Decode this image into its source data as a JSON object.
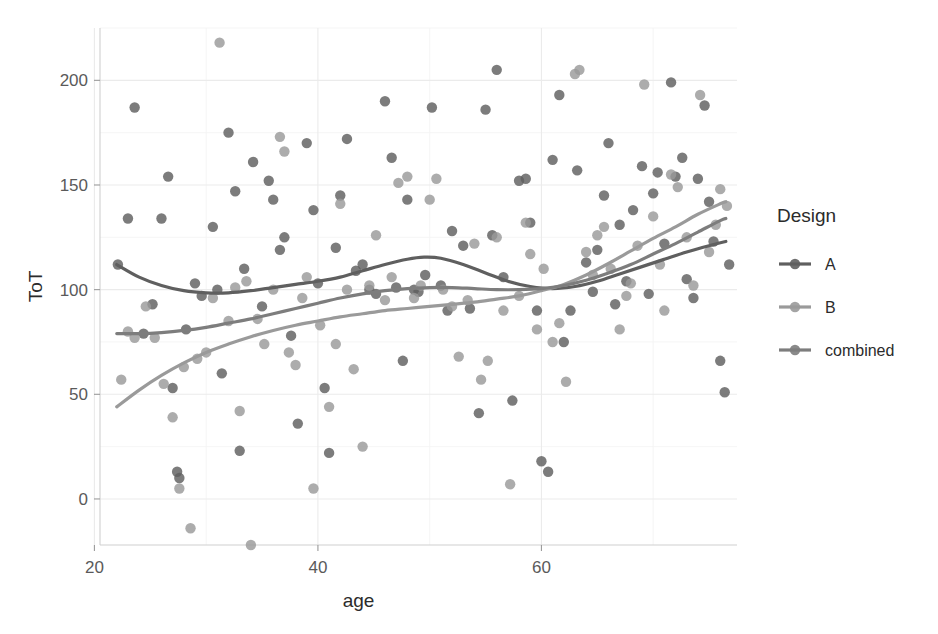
{
  "chart_data": {
    "type": "scatter",
    "title": "",
    "xlabel": "age",
    "ylabel": "ToT",
    "xlim": [
      20.5,
      77.5
    ],
    "ylim": [
      -22,
      225
    ],
    "xticks": [
      20,
      40,
      60
    ],
    "yticks": [
      0,
      50,
      100,
      150,
      200
    ],
    "xticklabels": [
      "20",
      "40",
      "60"
    ],
    "yticklabels": [
      "0",
      "50",
      "100",
      "150",
      "200"
    ],
    "grid": true,
    "grid_minor_x": [
      30,
      50,
      70
    ],
    "grid_minor_y": [
      25,
      75,
      125,
      175,
      225
    ],
    "legend": {
      "title": "Design",
      "position": "right",
      "entries": [
        {
          "label": "A",
          "color": "#5f5f5f"
        },
        {
          "label": "B",
          "color": "#9a9a9a"
        },
        {
          "label": "combined",
          "color": "#7d7d7d"
        }
      ]
    },
    "series": [
      {
        "name": "A",
        "color": "#5f5f5f",
        "points": [
          [
            22.1,
            112
          ],
          [
            23.0,
            134
          ],
          [
            23.6,
            187
          ],
          [
            24.4,
            79
          ],
          [
            25.2,
            93
          ],
          [
            26.0,
            134
          ],
          [
            26.6,
            154
          ],
          [
            27.0,
            53
          ],
          [
            27.4,
            13
          ],
          [
            27.6,
            10
          ],
          [
            28.2,
            81
          ],
          [
            29.0,
            103
          ],
          [
            29.6,
            97
          ],
          [
            30.6,
            130
          ],
          [
            31.0,
            100
          ],
          [
            31.4,
            60
          ],
          [
            32.0,
            175
          ],
          [
            32.6,
            147
          ],
          [
            33.0,
            23
          ],
          [
            33.4,
            110
          ],
          [
            34.2,
            161
          ],
          [
            35.0,
            92
          ],
          [
            35.6,
            152
          ],
          [
            36.0,
            143
          ],
          [
            36.6,
            119
          ],
          [
            37.0,
            125
          ],
          [
            37.6,
            78
          ],
          [
            38.2,
            36
          ],
          [
            39.0,
            170
          ],
          [
            39.6,
            138
          ],
          [
            40.0,
            103
          ],
          [
            40.6,
            53
          ],
          [
            41.0,
            22
          ],
          [
            41.6,
            120
          ],
          [
            42.0,
            145
          ],
          [
            42.6,
            172
          ],
          [
            43.4,
            109
          ],
          [
            44.0,
            112
          ],
          [
            44.6,
            100
          ],
          [
            45.2,
            98
          ],
          [
            46.0,
            190
          ],
          [
            46.6,
            163
          ],
          [
            47.0,
            101
          ],
          [
            47.6,
            66
          ],
          [
            48.0,
            143
          ],
          [
            48.6,
            100
          ],
          [
            49.0,
            99
          ],
          [
            49.6,
            107
          ],
          [
            50.2,
            187
          ],
          [
            51.0,
            102
          ],
          [
            51.6,
            90
          ],
          [
            52.0,
            128
          ],
          [
            53.0,
            121
          ],
          [
            53.6,
            91
          ],
          [
            54.4,
            41
          ],
          [
            55.0,
            186
          ],
          [
            55.6,
            126
          ],
          [
            56.0,
            205
          ],
          [
            56.6,
            106
          ],
          [
            57.4,
            47
          ],
          [
            58.0,
            152
          ],
          [
            58.6,
            153
          ],
          [
            59.0,
            132
          ],
          [
            59.6,
            90
          ],
          [
            60.0,
            18
          ],
          [
            60.6,
            13
          ],
          [
            61.0,
            162
          ],
          [
            61.6,
            193
          ],
          [
            62.0,
            75
          ],
          [
            62.6,
            90
          ],
          [
            63.2,
            157
          ],
          [
            64.0,
            113
          ],
          [
            64.6,
            99
          ],
          [
            65.0,
            119
          ],
          [
            65.6,
            145
          ],
          [
            66.0,
            170
          ],
          [
            66.6,
            93
          ],
          [
            67.0,
            131
          ],
          [
            67.6,
            104
          ],
          [
            68.2,
            138
          ],
          [
            69.0,
            159
          ],
          [
            69.6,
            98
          ],
          [
            70.0,
            146
          ],
          [
            70.4,
            156
          ],
          [
            71.0,
            122
          ],
          [
            71.6,
            199
          ],
          [
            72.0,
            154
          ],
          [
            72.6,
            163
          ],
          [
            73.0,
            105
          ],
          [
            73.6,
            96
          ],
          [
            74.0,
            153
          ],
          [
            74.6,
            188
          ],
          [
            75.0,
            142
          ],
          [
            75.4,
            123
          ],
          [
            76.0,
            66
          ],
          [
            76.4,
            51
          ],
          [
            76.8,
            112
          ]
        ]
      },
      {
        "name": "B",
        "color": "#9a9a9a",
        "points": [
          [
            22.4,
            57
          ],
          [
            23.0,
            80
          ],
          [
            23.6,
            77
          ],
          [
            24.6,
            92
          ],
          [
            25.4,
            77
          ],
          [
            26.2,
            55
          ],
          [
            27.0,
            39
          ],
          [
            27.6,
            5
          ],
          [
            28.0,
            63
          ],
          [
            28.6,
            -14
          ],
          [
            29.2,
            67
          ],
          [
            30.0,
            70
          ],
          [
            30.6,
            96
          ],
          [
            31.2,
            218
          ],
          [
            32.0,
            85
          ],
          [
            32.6,
            101
          ],
          [
            33.0,
            42
          ],
          [
            33.6,
            104
          ],
          [
            34.0,
            -22
          ],
          [
            34.6,
            86
          ],
          [
            35.2,
            74
          ],
          [
            36.0,
            100
          ],
          [
            36.6,
            173
          ],
          [
            37.0,
            166
          ],
          [
            37.4,
            70
          ],
          [
            38.0,
            64
          ],
          [
            38.6,
            96
          ],
          [
            39.0,
            106
          ],
          [
            39.6,
            5
          ],
          [
            40.2,
            83
          ],
          [
            41.0,
            44
          ],
          [
            41.6,
            74
          ],
          [
            42.0,
            141
          ],
          [
            42.6,
            100
          ],
          [
            43.2,
            62
          ],
          [
            44.0,
            25
          ],
          [
            44.6,
            102
          ],
          [
            45.2,
            126
          ],
          [
            46.0,
            95
          ],
          [
            46.6,
            106
          ],
          [
            47.2,
            151
          ],
          [
            48.0,
            154
          ],
          [
            48.6,
            96
          ],
          [
            49.2,
            102
          ],
          [
            50.0,
            143
          ],
          [
            50.6,
            153
          ],
          [
            51.2,
            100
          ],
          [
            52.0,
            92
          ],
          [
            52.6,
            68
          ],
          [
            53.4,
            95
          ],
          [
            54.0,
            122
          ],
          [
            54.6,
            57
          ],
          [
            55.2,
            66
          ],
          [
            56.0,
            125
          ],
          [
            56.6,
            90
          ],
          [
            57.2,
            7
          ],
          [
            58.0,
            97
          ],
          [
            58.6,
            132
          ],
          [
            59.0,
            117
          ],
          [
            59.6,
            81
          ],
          [
            60.2,
            110
          ],
          [
            61.0,
            75
          ],
          [
            61.6,
            84
          ],
          [
            62.2,
            56
          ],
          [
            63.0,
            203
          ],
          [
            63.4,
            205
          ],
          [
            64.0,
            118
          ],
          [
            64.6,
            107
          ],
          [
            65.0,
            126
          ],
          [
            65.6,
            130
          ],
          [
            66.2,
            110
          ],
          [
            67.0,
            81
          ],
          [
            67.6,
            97
          ],
          [
            68.0,
            103
          ],
          [
            68.6,
            121
          ],
          [
            69.2,
            198
          ],
          [
            70.0,
            135
          ],
          [
            70.6,
            112
          ],
          [
            71.0,
            90
          ],
          [
            71.6,
            155
          ],
          [
            72.2,
            149
          ],
          [
            73.0,
            125
          ],
          [
            73.6,
            102
          ],
          [
            74.2,
            193
          ],
          [
            75.0,
            118
          ],
          [
            75.6,
            131
          ],
          [
            76.0,
            148
          ],
          [
            76.6,
            140
          ]
        ]
      }
    ],
    "trend_lines": [
      {
        "name": "A",
        "color": "#5f5f5f",
        "width": 3.2,
        "path": [
          [
            22.0,
            112
          ],
          [
            24.0,
            106
          ],
          [
            26.0,
            102
          ],
          [
            28.0,
            99.5
          ],
          [
            30.0,
            98.5
          ],
          [
            32.0,
            98.5
          ],
          [
            34.0,
            99.5
          ],
          [
            36.0,
            101
          ],
          [
            38.0,
            102.5
          ],
          [
            40.0,
            104
          ],
          [
            42.0,
            106
          ],
          [
            44.0,
            109
          ],
          [
            46.0,
            112
          ],
          [
            48.0,
            114.5
          ],
          [
            49.5,
            115.5
          ],
          [
            51.0,
            115
          ],
          [
            53.0,
            112
          ],
          [
            55.0,
            108
          ],
          [
            57.0,
            104
          ],
          [
            59.0,
            101.5
          ],
          [
            61.0,
            100.5
          ],
          [
            63.0,
            101.5
          ],
          [
            65.0,
            104
          ],
          [
            67.0,
            107.5
          ],
          [
            69.0,
            111
          ],
          [
            71.0,
            114.5
          ],
          [
            73.0,
            118
          ],
          [
            75.0,
            121
          ],
          [
            76.5,
            123
          ]
        ]
      },
      {
        "name": "B",
        "color": "#9a9a9a",
        "width": 3.2,
        "path": [
          [
            22.0,
            44
          ],
          [
            24.0,
            52
          ],
          [
            26.0,
            59
          ],
          [
            28.0,
            65
          ],
          [
            30.0,
            70
          ],
          [
            32.0,
            74
          ],
          [
            34.0,
            77.5
          ],
          [
            36.0,
            80.5
          ],
          [
            38.0,
            83
          ],
          [
            40.0,
            85
          ],
          [
            42.0,
            87
          ],
          [
            44.0,
            88.5
          ],
          [
            46.0,
            90
          ],
          [
            48.0,
            91
          ],
          [
            50.0,
            92
          ],
          [
            52.0,
            93
          ],
          [
            54.0,
            94
          ],
          [
            56.0,
            95.5
          ],
          [
            58.0,
            97
          ],
          [
            60.0,
            99.5
          ],
          [
            62.0,
            102.5
          ],
          [
            64.0,
            107
          ],
          [
            66.0,
            112.5
          ],
          [
            68.0,
            118.5
          ],
          [
            70.0,
            124.5
          ],
          [
            72.0,
            130
          ],
          [
            74.0,
            136
          ],
          [
            76.0,
            141
          ],
          [
            76.5,
            142
          ]
        ]
      },
      {
        "name": "combined",
        "color": "#7d7d7d",
        "width": 3.2,
        "path": [
          [
            22.0,
            79
          ],
          [
            24.0,
            79
          ],
          [
            26.0,
            79.5
          ],
          [
            28.0,
            80.5
          ],
          [
            30.0,
            82
          ],
          [
            32.0,
            84
          ],
          [
            34.0,
            86
          ],
          [
            36.0,
            88.5
          ],
          [
            38.0,
            91
          ],
          [
            40.0,
            93.5
          ],
          [
            42.0,
            96
          ],
          [
            44.0,
            98
          ],
          [
            46.0,
            99.5
          ],
          [
            48.0,
            100.5
          ],
          [
            50.0,
            101
          ],
          [
            52.0,
            101
          ],
          [
            54.0,
            100.5
          ],
          [
            56.0,
            100
          ],
          [
            58.0,
            100
          ],
          [
            60.0,
            100.5
          ],
          [
            62.0,
            102
          ],
          [
            64.0,
            104.5
          ],
          [
            66.0,
            108
          ],
          [
            68.0,
            112
          ],
          [
            70.0,
            117
          ],
          [
            72.0,
            122
          ],
          [
            74.0,
            127.5
          ],
          [
            76.0,
            133
          ],
          [
            76.5,
            134
          ]
        ]
      }
    ]
  },
  "axes": {
    "x_title": "age",
    "y_title": "ToT"
  },
  "legend": {
    "title": "Design",
    "items": [
      {
        "label": "A"
      },
      {
        "label": "B"
      },
      {
        "label": "combined"
      }
    ]
  },
  "colors": {
    "series_a": "#5f5f5f",
    "series_b": "#9a9a9a",
    "series_combined": "#7d7d7d",
    "grid_major": "#ebebeb",
    "grid_minor": "#f4f4f4",
    "panel_bg": "#ffffff",
    "text": "#2b2b2b",
    "tick_text": "#5a5a5a"
  }
}
